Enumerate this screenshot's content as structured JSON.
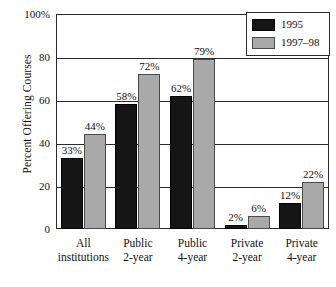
{
  "chart_data": {
    "type": "bar",
    "title": "",
    "xlabel": "",
    "ylabel": "Percent Offering Courses",
    "ylim": [
      0,
      100
    ],
    "grid": true,
    "legend_position": "top-right",
    "categories": [
      "All institutions",
      "Public 2-year",
      "Public 4-year",
      "Private 2-year",
      "Private 4-year"
    ],
    "category_lines": [
      [
        "All",
        "institutions"
      ],
      [
        "Public",
        "2-year"
      ],
      [
        "Public",
        "4-year"
      ],
      [
        "Private",
        "2-year"
      ],
      [
        "Private",
        "4-year"
      ]
    ],
    "ytick_labels": [
      "0",
      "20",
      "40",
      "60",
      "80",
      "100%"
    ],
    "ytick_values": [
      0,
      20,
      40,
      60,
      80,
      100
    ],
    "series": [
      {
        "name": "1995",
        "color": "#151515",
        "values": [
          33,
          58,
          62,
          2,
          12
        ],
        "data_labels": [
          "33%",
          "58%",
          "62%",
          "2%",
          "12%"
        ]
      },
      {
        "name": "1997–98",
        "color": "#a9a9a9",
        "values": [
          44,
          72,
          79,
          6,
          22
        ],
        "data_labels": [
          "44%",
          "72%",
          "79%",
          "6%",
          "22%"
        ]
      }
    ]
  },
  "legend": {
    "entries": [
      {
        "label": "1995"
      },
      {
        "label": "1997–98"
      }
    ]
  },
  "axes": {
    "y_title": "Percent Offering Courses"
  }
}
